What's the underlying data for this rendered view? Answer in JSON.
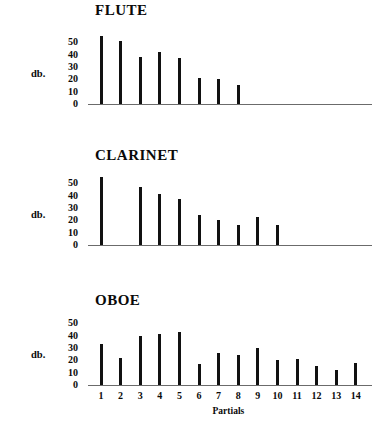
{
  "figure": {
    "x_axis_title": "Partials",
    "y_axis_title": "db.",
    "y_ticks": [
      "50",
      "40",
      "30",
      "20",
      "10",
      "0"
    ],
    "x_ticks": [
      "1",
      "2",
      "3",
      "4",
      "5",
      "6",
      "7",
      "8",
      "9",
      "10",
      "11",
      "12",
      "13",
      "14"
    ],
    "colors": {
      "bar": "#111111",
      "axis": "#6b6b6b",
      "text": "#0a0a0a"
    }
  },
  "panels": [
    {
      "title": "FLUTE"
    },
    {
      "title": "CLARINET"
    },
    {
      "title": "OBOE"
    }
  ],
  "chart_data": [
    {
      "type": "bar",
      "title": "FLUTE",
      "xlabel": "",
      "ylabel": "db.",
      "categories": [
        "1",
        "2",
        "3",
        "4",
        "5",
        "6",
        "7",
        "8",
        "9",
        "10",
        "11",
        "12",
        "13",
        "14"
      ],
      "values": [
        55,
        51,
        38,
        42,
        37,
        21,
        20,
        15,
        0,
        0,
        0,
        0,
        0,
        0
      ],
      "ylim": [
        0,
        55
      ],
      "ytick_values": [
        50,
        40,
        30,
        20,
        10,
        0
      ],
      "grid": false,
      "legend": "none"
    },
    {
      "type": "bar",
      "title": "CLARINET",
      "xlabel": "",
      "ylabel": "db.",
      "categories": [
        "1",
        "2",
        "3",
        "4",
        "5",
        "6",
        "7",
        "8",
        "9",
        "10",
        "11",
        "12",
        "13",
        "14"
      ],
      "values": [
        55,
        0,
        47,
        41,
        37,
        24,
        20,
        16,
        23,
        16,
        0,
        0,
        0,
        0
      ],
      "ylim": [
        0,
        55
      ],
      "ytick_values": [
        50,
        40,
        30,
        20,
        10,
        0
      ],
      "grid": false,
      "legend": "none"
    },
    {
      "type": "bar",
      "title": "OBOE",
      "xlabel": "Partials",
      "ylabel": "db.",
      "categories": [
        "1",
        "2",
        "3",
        "4",
        "5",
        "6",
        "7",
        "8",
        "9",
        "10",
        "11",
        "12",
        "13",
        "14"
      ],
      "values": [
        33,
        22,
        40,
        41,
        43,
        17,
        26,
        24,
        30,
        20,
        21,
        15,
        12,
        18
      ],
      "ylim": [
        0,
        55
      ],
      "ytick_values": [
        50,
        40,
        30,
        20,
        10,
        0
      ],
      "grid": false,
      "legend": "none"
    }
  ]
}
